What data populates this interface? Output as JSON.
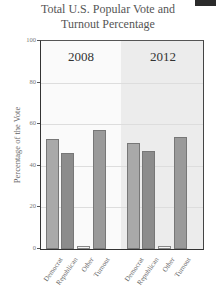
{
  "chart_data": {
    "type": "bar",
    "title": "Total U.S. Popular Vote and Turnout Percentage",
    "xlabel": "",
    "ylabel": "Percentage of the Vote",
    "ylim": [
      0,
      100
    ],
    "yticks": [
      0,
      20,
      40,
      60,
      80,
      100
    ],
    "grid": true,
    "panels": [
      "2008",
      "2012"
    ],
    "categories": [
      "Democrat",
      "Republican",
      "Other",
      "Turnout"
    ],
    "series": [
      {
        "name": "2008",
        "values": [
          53,
          46,
          1.5,
          57
        ]
      },
      {
        "name": "2012",
        "values": [
          51,
          47,
          1.5,
          54
        ]
      }
    ],
    "colors": {
      "Democrat": "#a9a9a9",
      "Republican": "#8c8c8c",
      "Other": "#f4f4f4",
      "Turnout": "#9a9a9a"
    }
  },
  "title_line1": "Total U.S. Popular Vote and",
  "title_line2": "Turnout Percentage",
  "ylabel": "Percentage of the Vote",
  "panel_labels": [
    "2008",
    "2012"
  ],
  "yticks": [
    "100",
    "80",
    "60",
    "40",
    "20",
    "0"
  ],
  "xlabels": [
    "Democrat",
    "Republican",
    "Other",
    "Turnout",
    "Democrat",
    "Republican",
    "Other",
    "Turnout"
  ]
}
